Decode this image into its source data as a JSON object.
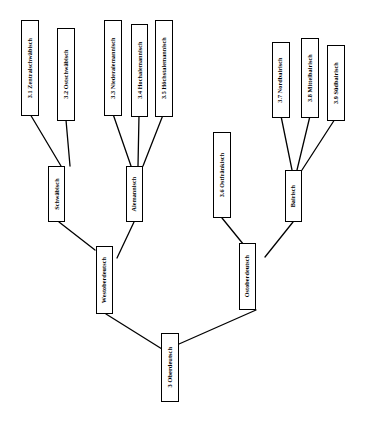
{
  "diagram": {
    "title": "3 Oberdeutsch",
    "type": "tree",
    "orientation": "bottom-up",
    "label_rotation": "-90deg",
    "colors": {
      "background": "#ffffff",
      "box_border": "#000000",
      "box_fill": "#ffffff",
      "edge": "#000000",
      "text": "#000000"
    }
  },
  "nodes": {
    "zentralschwaebisch": {
      "label": "3.1 Zentralschwäbisch",
      "level": "leaf"
    },
    "ostschwaebisch": {
      "label": "3.2 Ostschwäbisch",
      "level": "leaf"
    },
    "niederalemannisch": {
      "label": "3.3 Niederalemannisch",
      "level": "leaf"
    },
    "hochalemannisch": {
      "label": "3.4 Hochalemannisch",
      "level": "leaf"
    },
    "hoechstalemannisch": {
      "label": "3.5 Höchstalemannisch",
      "level": "leaf"
    },
    "ostfraenkisch": {
      "label": "3.6 Ostfränkisch",
      "level": "leaf"
    },
    "nordbairisch": {
      "label": "3.7 Nordbairisch",
      "level": "leaf"
    },
    "mittelbairisch": {
      "label": "3.8 Mittelbairisch",
      "level": "leaf"
    },
    "suedbairisch": {
      "label": "3.9 Südbairisch",
      "level": "leaf"
    },
    "schwaebisch": {
      "label": "Schwäbisch",
      "level": "internal"
    },
    "alemannisch": {
      "label": "Alemannisch",
      "level": "internal"
    },
    "bairisch": {
      "label": "Bairisch",
      "level": "internal"
    },
    "westoberdeutsch": {
      "label": "Westoberdeutsch",
      "level": "internal"
    },
    "ostoberdeutsch": {
      "label": "Ostoberdeutsch",
      "level": "internal"
    },
    "oberdeutsch": {
      "label": "3 Oberdeutsch",
      "level": "root"
    }
  },
  "edges": [
    {
      "from": "zentralschwaebisch",
      "to": "schwaebisch"
    },
    {
      "from": "ostschwaebisch",
      "to": "schwaebisch"
    },
    {
      "from": "niederalemannisch",
      "to": "alemannisch"
    },
    {
      "from": "hochalemannisch",
      "to": "alemannisch"
    },
    {
      "from": "hoechstalemannisch",
      "to": "alemannisch"
    },
    {
      "from": "nordbairisch",
      "to": "bairisch"
    },
    {
      "from": "mittelbairisch",
      "to": "bairisch"
    },
    {
      "from": "suedbairisch",
      "to": "bairisch"
    },
    {
      "from": "schwaebisch",
      "to": "westoberdeutsch"
    },
    {
      "from": "alemannisch",
      "to": "westoberdeutsch"
    },
    {
      "from": "ostfraenkisch",
      "to": "ostoberdeutsch"
    },
    {
      "from": "bairisch",
      "to": "ostoberdeutsch"
    },
    {
      "from": "westoberdeutsch",
      "to": "oberdeutsch"
    },
    {
      "from": "ostoberdeutsch",
      "to": "oberdeutsch"
    }
  ]
}
